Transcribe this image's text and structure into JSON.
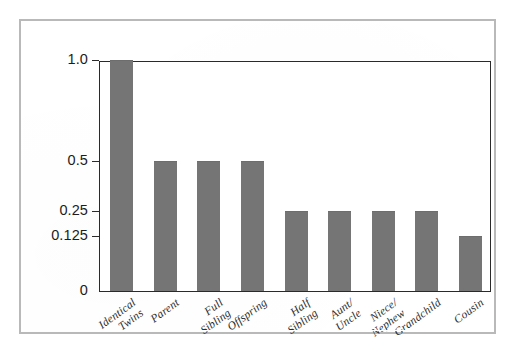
{
  "chart_data": {
    "type": "bar",
    "title": "",
    "subtitle": "",
    "xlabel": "",
    "ylabel": "",
    "grid": false,
    "legend": null,
    "axis_scale_note": "non-linear y axis: ticks 0, 0.125, 0.25, 0.5, 1.0 are evenly weighted toward the low end",
    "ylim": [
      0,
      1.0
    ],
    "ytick_labels": [
      "1.0",
      "0.5",
      "0.25",
      "0.125",
      "0"
    ],
    "ytick_values": [
      1.0,
      0.5,
      0.25,
      0.125,
      0
    ],
    "ytick_pixel_fraction": [
      1.0,
      0.563,
      0.345,
      0.236,
      0.0
    ],
    "categories": [
      "Identical Twins",
      "Parent",
      "Full Sibling",
      "Offspring",
      "Half Sibling",
      "Aunt/ Uncle",
      "Niece/ Nephew",
      "Grandchild",
      "Cousin"
    ],
    "category_lines": [
      [
        "Identical",
        "Twins"
      ],
      [
        "Parent",
        ""
      ],
      [
        "Full",
        "Sibling"
      ],
      [
        "Offspring",
        ""
      ],
      [
        "Half",
        "Sibling"
      ],
      [
        "Aunt/",
        "Uncle"
      ],
      [
        "Niece/",
        "Nephew"
      ],
      [
        "Grandchild",
        ""
      ],
      [
        "Cousin",
        ""
      ]
    ],
    "values": [
      1.0,
      0.5,
      0.5,
      0.5,
      0.25,
      0.25,
      0.25,
      0.25,
      0.125
    ],
    "bar_color": "#757575",
    "frame_color": "#2a2a2a",
    "outer_border_color": "#b9b9b9",
    "background_color": "#ffffff"
  }
}
